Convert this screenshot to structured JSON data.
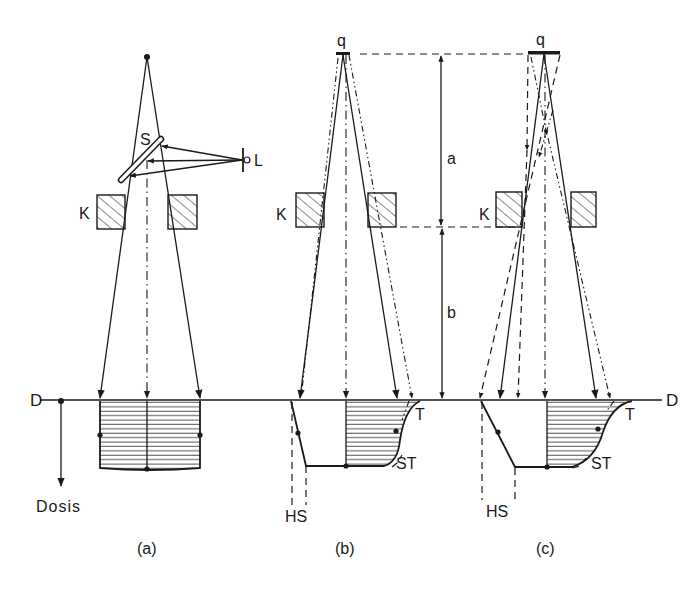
{
  "figure": {
    "panels": [
      {
        "id": "a",
        "caption": "(a)",
        "source_label": "",
        "mirror_label": "S",
        "light_label": "L",
        "collimator_label": "K"
      },
      {
        "id": "b",
        "caption": "(b)",
        "source_label": "q",
        "collimator_label": "K",
        "penumbra_label": "HS",
        "transmission_label": "T",
        "scatter_label": "ST"
      },
      {
        "id": "c",
        "caption": "(c)",
        "source_label": "q",
        "collimator_label": "K",
        "penumbra_label": "HS",
        "transmission_label": "T",
        "scatter_label": "ST"
      }
    ],
    "dimension_labels": {
      "a": "a",
      "b": "b"
    },
    "depth_line_label_left": "D",
    "depth_line_label_right": "D",
    "dose_axis_label": "Dosis"
  }
}
